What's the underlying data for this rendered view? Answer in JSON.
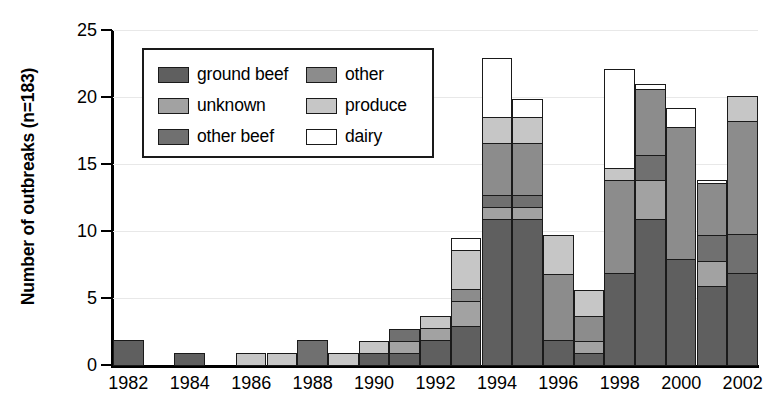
{
  "chart_data": {
    "type": "bar",
    "subtype": "stacked-bar",
    "title": "",
    "xlabel": "",
    "ylabel": "Number of outbreaks (n=183)",
    "ylim": [
      0,
      25
    ],
    "yticks": [
      0,
      5,
      10,
      15,
      20,
      25
    ],
    "xticks_shown": [
      "1982",
      "1984",
      "1986",
      "1988",
      "1990",
      "1992",
      "1994",
      "1996",
      "1998",
      "2000",
      "2002"
    ],
    "grid": true,
    "legend_position": "upper-left-inside",
    "categories": [
      "1982",
      "1983",
      "1984",
      "1985",
      "1986",
      "1987",
      "1988",
      "1989",
      "1990",
      "1991",
      "1992",
      "1993",
      "1994",
      "1995",
      "1996",
      "1997",
      "1998",
      "1999",
      "2000",
      "2001",
      "2002"
    ],
    "series": [
      {
        "name": "ground beef",
        "color": "#5f5f5f",
        "values": [
          2,
          0,
          1,
          0,
          0,
          0,
          0,
          0,
          1,
          1,
          2,
          3,
          11,
          11,
          2,
          1,
          7,
          11,
          8,
          6,
          7
        ]
      },
      {
        "name": "other beef",
        "color": "#707070",
        "values": [
          0,
          0,
          0,
          0,
          0,
          0,
          2,
          0,
          0,
          1,
          0,
          0,
          1,
          1,
          0,
          0,
          0,
          2,
          0,
          2,
          3
        ]
      },
      {
        "name": "produce",
        "color": "#c6c6c6",
        "values": [
          0,
          0,
          0,
          0,
          1,
          1,
          0,
          1,
          1,
          0,
          1,
          3,
          2,
          2,
          3,
          2,
          1,
          0,
          0,
          0,
          2
        ]
      },
      {
        "name": "unknown",
        "color": "#a2a2a2",
        "values": [
          0,
          0,
          0,
          0,
          0,
          0,
          0,
          0,
          0,
          1,
          1,
          2,
          1,
          1,
          0,
          1,
          0,
          3,
          0,
          2,
          0
        ]
      },
      {
        "name": "other",
        "color": "#8c8c8c",
        "values": [
          0,
          0,
          0,
          0,
          0,
          0,
          0,
          0,
          0,
          0,
          0,
          1,
          4,
          4,
          5,
          2,
          7,
          5,
          10,
          4,
          8.5
        ]
      },
      {
        "name": "dairy",
        "color": "#ffffff",
        "values": [
          0,
          0,
          0,
          0,
          0,
          0,
          0,
          0,
          0,
          0,
          0,
          1,
          4.5,
          1.5,
          0.1,
          0,
          7.5,
          0.5,
          1.5,
          0.3,
          0
        ]
      }
    ],
    "totals": [
      2,
      0,
      1,
      0,
      1,
      1,
      2,
      1,
      2,
      3,
      4,
      10,
      23.5,
      20.5,
      10.1,
      6,
      22.5,
      21.5,
      19.5,
      14.3,
      20.5
    ]
  },
  "legend": {
    "entries": [
      {
        "label": "ground beef",
        "color": "#5f5f5f"
      },
      {
        "label": "other",
        "color": "#8c8c8c"
      },
      {
        "label": "unknown",
        "color": "#a2a2a2"
      },
      {
        "label": "produce",
        "color": "#c6c6c6"
      },
      {
        "label": "other beef",
        "color": "#707070"
      },
      {
        "label": "dairy",
        "color": "#ffffff"
      }
    ]
  }
}
